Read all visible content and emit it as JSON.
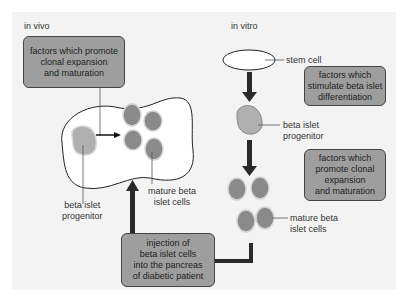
{
  "sections": {
    "in_vivo": "in vivo",
    "in_vitro": "in vitro"
  },
  "in_vivo": {
    "factors_box": "factors which promote\nclonal expansion\nand maturation",
    "progenitor_label": "beta islet\nprogenitor",
    "mature_label": "mature beta\nislet cells"
  },
  "in_vitro": {
    "stem_cell_label": "stem cell",
    "differentiation_box": "factors which\nstimulate beta islet\ndifferentiation",
    "progenitor_label": "beta islet\nprogenitor",
    "expansion_box": "factors which\npromote clonal\nexpansion\nand maturation",
    "mature_label": "mature beta\nislet cells"
  },
  "injection_box": "injection of\nbeta islet cells\ninto the pancreas\nof diabetic patient",
  "colors": {
    "box_fill": "#9e9e9e",
    "cell_fill": "#8a8a8a",
    "progenitor_fill": "#b0b0b0",
    "arrow": "#2a2a2a",
    "panel_bg": "#f3f3f3"
  }
}
